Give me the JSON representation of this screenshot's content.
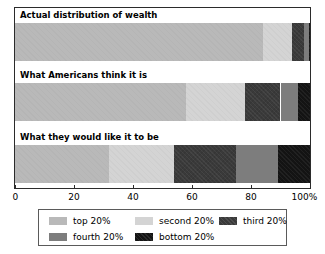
{
  "chart_data": {
    "type": "bar",
    "orientation": "horizontal",
    "stacked": true,
    "normalized_percent": true,
    "title": "",
    "subtitle": "",
    "xlabel": "",
    "ylabel": "",
    "xlim": [
      0,
      100
    ],
    "grid": false,
    "legend_position": "bottom",
    "categories": [
      "Actual distribution of wealth",
      "What Americans think it is",
      "What they would like it to be"
    ],
    "series": [
      {
        "name": "top 20%",
        "color": "#b9b9b9",
        "values": [
          84,
          58,
          32
        ]
      },
      {
        "name": "second 20%",
        "color": "#d4d4d4",
        "values": [
          10,
          20,
          22
        ]
      },
      {
        "name": "third 20%",
        "color": "#3a3a3a",
        "values": [
          4,
          12,
          21
        ]
      },
      {
        "name": "fourth 20%",
        "color": "#7d7d7d",
        "values": [
          1.5,
          6,
          14
        ]
      },
      {
        "name": "bottom 20%",
        "color": "#141414",
        "values": [
          0.5,
          4,
          11
        ]
      }
    ],
    "x_ticks": [
      {
        "value": 0,
        "label": "0"
      },
      {
        "value": 20,
        "label": "20"
      },
      {
        "value": 40,
        "label": "40"
      },
      {
        "value": 60,
        "label": "60"
      },
      {
        "value": 80,
        "label": "80"
      },
      {
        "value": 100,
        "label": "100%"
      }
    ],
    "legend_entries": [
      {
        "label": "top 20%",
        "color": "#b9b9b9",
        "texture": "flat"
      },
      {
        "label": "second 20%",
        "color": "#d4d4d4",
        "texture": "flat"
      },
      {
        "label": "third 20%",
        "color": "#3a3a3a",
        "texture": "noisy"
      },
      {
        "label": "fourth 20%",
        "color": "#7d7d7d",
        "texture": "flat"
      },
      {
        "label": "bottom 20%",
        "color": "#141414",
        "texture": "noisy"
      }
    ],
    "colors": {
      "plot_border": "#2b2b2b",
      "legend_border": "#5a5a5a",
      "background": "#ffffff",
      "text": "#000000"
    }
  }
}
